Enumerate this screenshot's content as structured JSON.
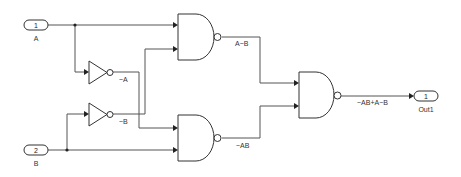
{
  "diagram": {
    "type": "logic-circuit (Simulink XOR from NAND/NOT)",
    "inports": [
      {
        "number": "1",
        "name": "A"
      },
      {
        "number": "2",
        "name": "B"
      }
    ],
    "outports": [
      {
        "number": "1",
        "name": "Out1"
      }
    ],
    "not_gates": [
      {
        "output_label": "~A"
      },
      {
        "output_label": "~B"
      }
    ],
    "nand_gates": [
      {
        "output_label": "A~B"
      },
      {
        "output_label": "~AB"
      },
      {
        "output_label": "~AB+A~B"
      }
    ],
    "colors": {
      "wire": "#555555",
      "block_border": "#333333",
      "background": "#ffffff"
    }
  }
}
